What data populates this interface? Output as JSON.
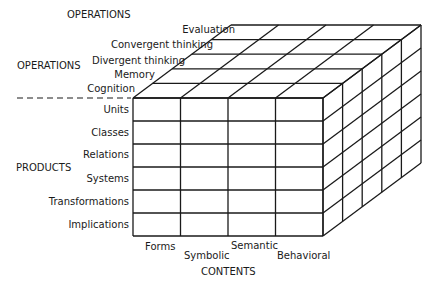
{
  "axes": {
    "operations_title_top": "OPERATIONS",
    "operations_title_left": "OPERATIONS",
    "products_title": "PRODUCTS",
    "contents_title": "CONTENTS"
  },
  "operations": [
    "Cognition",
    "Memory",
    "Divergent thinking",
    "Convergent thinking",
    "Evaluation"
  ],
  "products": [
    "Units",
    "Classes",
    "Relations",
    "Systems",
    "Transformations",
    "Implications"
  ],
  "contents": [
    "Forms",
    "Symbolic",
    "Semantic",
    "Behavioral"
  ],
  "colors": {
    "line": "#1a1a1a",
    "background": "#ffffff"
  }
}
